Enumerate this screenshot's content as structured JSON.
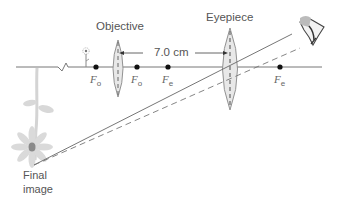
{
  "diagram": {
    "type": "optics-ray-diagram",
    "labels": {
      "objective": "Objective",
      "eyepiece": "Eyepiece",
      "separation": "7.0 cm",
      "final_image_line1": "Final",
      "final_image_line2": "image"
    },
    "focal_points": [
      {
        "id": "fo-left",
        "letter": "F",
        "sub": "o",
        "x": 96
      },
      {
        "id": "fo-right",
        "letter": "F",
        "sub": "o",
        "x": 137
      },
      {
        "id": "fe-left",
        "letter": "F",
        "sub": "e",
        "x": 168
      },
      {
        "id": "fe-right",
        "letter": "F",
        "sub": "e",
        "x": 280
      }
    ],
    "lenses": [
      {
        "name": "objective",
        "x": 118,
        "top": 40,
        "bottom": 97
      },
      {
        "name": "eyepiece",
        "x": 230,
        "top": 28,
        "bottom": 110
      }
    ],
    "axis": {
      "y": 67,
      "x_start": 16,
      "x_end": 322
    },
    "rays": [
      {
        "style": "solid",
        "from": [
          34,
          165
        ],
        "to": [
          292,
          34
        ]
      },
      {
        "style": "dashed",
        "from": [
          34,
          165
        ],
        "to": [
          300,
          48
        ]
      }
    ],
    "colors": {
      "line": "#777777",
      "lens_fill": "#e6e6e6",
      "lens_stroke": "#888888",
      "dot": "#111111",
      "flower": "#d0d0d0",
      "flower_center": "#888888",
      "text": "#555555"
    }
  }
}
